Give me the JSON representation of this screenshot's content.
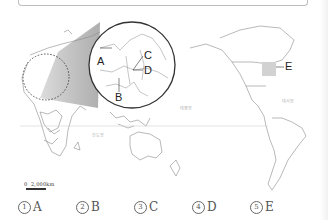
{
  "map": {
    "inset_labels": [
      "A",
      "B",
      "C",
      "D"
    ],
    "external_label": "E",
    "ocean_labels": [
      "태평양",
      "대서양",
      "인도양"
    ],
    "scale": {
      "zero": "0",
      "distance": "2,000km"
    }
  },
  "options": [
    {
      "num": "1",
      "label": "A"
    },
    {
      "num": "2",
      "label": "B"
    },
    {
      "num": "3",
      "label": "C"
    },
    {
      "num": "4",
      "label": "D"
    },
    {
      "num": "5",
      "label": "E"
    }
  ]
}
